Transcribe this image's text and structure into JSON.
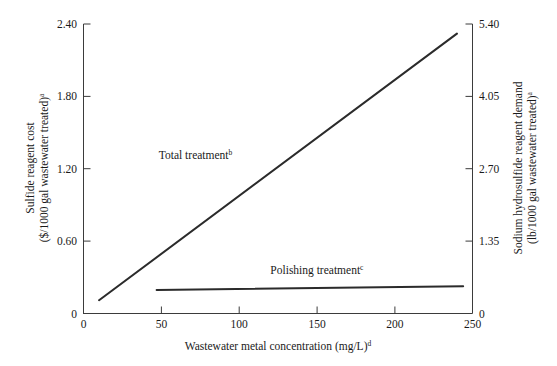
{
  "chart_data": {
    "type": "line",
    "title": "",
    "xlabel": "Wastewater metal concentration (mg/L)",
    "xlabel_sup": "d",
    "ylabel_left_line1": "Sulfide reagent cost",
    "ylabel_left_line2": "($/1000 gal wastewater treated)",
    "ylabel_left_sup": "a",
    "ylabel_right_line1": "Sodium hydrosulfide reagent demand",
    "ylabel_right_line2": "(lb/1000 gal wastewater treated)",
    "ylabel_right_sup": "a",
    "xlim": [
      0,
      250
    ],
    "ylim_left": [
      0,
      2.4
    ],
    "ylim_right": [
      0,
      5.4
    ],
    "grid": false,
    "legend_position": "inline-annotations",
    "x_ticks": [
      "0",
      "50",
      "100",
      "150",
      "200",
      "250"
    ],
    "x_tick_values": [
      0,
      50,
      100,
      150,
      200,
      250
    ],
    "y_ticks_left": [
      "0",
      "0.60",
      "1.20",
      "1.80",
      "2.40"
    ],
    "y_tick_values_left": [
      0,
      0.6,
      1.2,
      1.8,
      2.4
    ],
    "y_ticks_right": [
      "0",
      "1.35",
      "2.70",
      "4.05",
      "5.40"
    ],
    "y_tick_values_right": [
      0,
      1.35,
      2.7,
      4.05,
      5.4
    ],
    "series": [
      {
        "name": "Total treatment",
        "name_sup": "b",
        "label_x": 72,
        "label_y": 1.28,
        "color": "#2b2b2b",
        "x": [
          10,
          240
        ],
        "values": [
          0.11,
          2.32
        ]
      },
      {
        "name": "Polishing treatment",
        "name_sup": "c",
        "label_x": 150,
        "label_y": 0.33,
        "color": "#2b2b2b",
        "x": [
          47,
          244
        ],
        "values": [
          0.195,
          0.225
        ]
      }
    ]
  }
}
